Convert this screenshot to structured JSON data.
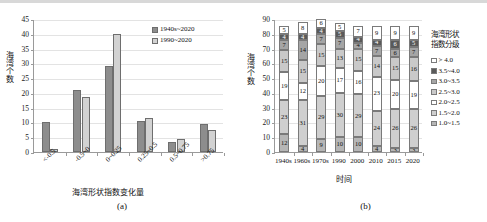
{
  "figure": {
    "panel_a_caption": "(a)",
    "panel_b_caption": "(b)"
  },
  "chart_data": [
    {
      "type": "bar",
      "panel": "(a)",
      "title": "",
      "xlabel": "海湾形状指数变化量",
      "ylabel": "海湾个数",
      "ylim": [
        0,
        45
      ],
      "yticks": [
        "0",
        "5",
        "10",
        "15",
        "20",
        "25",
        "30",
        "35",
        "40",
        "45"
      ],
      "grid": true,
      "legend_position": "top-right",
      "categories": [
        "<-0.5",
        "-0.5~0",
        "0~0.25",
        "0.25~0.5",
        "0.5~0.75",
        ">0.75"
      ],
      "series": [
        {
          "name": "1940s~2020",
          "color": "#8d8d8d",
          "values": [
            10,
            21,
            29,
            10.5,
            3.5,
            9.5
          ]
        },
        {
          "name": "1990~2020",
          "color": "#d2d2d2",
          "values": [
            1,
            18.5,
            40,
            11.5,
            4.5,
            7.5
          ]
        }
      ]
    },
    {
      "type": "bar",
      "subtype": "stacked",
      "panel": "(b)",
      "title": "",
      "xlabel": "时间",
      "ylabel": "海湾个数",
      "ylim": [
        0,
        90
      ],
      "yticks": [
        "0",
        "10",
        "20",
        "30",
        "40",
        "50",
        "60",
        "70",
        "80",
        "90"
      ],
      "grid": true,
      "legend_title": "海湾形状\n指数分级",
      "legend_position": "right",
      "categories": [
        "1940s",
        "1960s",
        "1970s",
        "1990",
        "2000",
        "2010",
        "2015",
        "2020"
      ],
      "series": [
        {
          "name": "1.0~1.5",
          "color": "#b6b6b6",
          "values": [
            12,
            4,
            9,
            10,
            10,
            4,
            3,
            3
          ]
        },
        {
          "name": "1.5~2.0",
          "color": "#cfcfcf",
          "values": [
            23,
            31,
            29,
            30,
            29,
            24,
            26,
            26
          ]
        },
        {
          "name": "2.0~2.5",
          "color": "#ffffff",
          "values": [
            19,
            12,
            20,
            17,
            16,
            23,
            20,
            19
          ]
        },
        {
          "name": "2.5~3.0",
          "color": "#c9c9c9",
          "values": [
            15,
            15,
            15,
            13,
            15,
            14,
            15,
            16
          ]
        },
        {
          "name": "3.0~3.5",
          "color": "#a5a5a5",
          "values": [
            7,
            14,
            7,
            7,
            4,
            7,
            6,
            7
          ]
        },
        {
          "name": "3.5~4.0",
          "color": "#5a5a5a",
          "values": [
            4,
            4,
            4,
            5,
            4,
            4,
            6,
            5
          ]
        },
        {
          "name": "> 4.0",
          "color": "#ffffff",
          "values": [
            5,
            8,
            6,
            5,
            7,
            9,
            9,
            9
          ]
        }
      ]
    }
  ]
}
